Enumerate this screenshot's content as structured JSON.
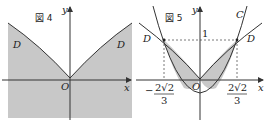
{
  "figure4": {
    "title": "図 4",
    "axis_y_label": "y",
    "axis_x_label": "x",
    "origin_label": "O",
    "curve_label_left": "D",
    "curve_label_right": "D",
    "shade_color": "#c8c8c8"
  },
  "figure5": {
    "title": "図 5",
    "axis_y_label": "y",
    "axis_x_label": "x",
    "origin_label": "O",
    "parabola_label": "C",
    "curve_label_left": "D",
    "curve_label_right": "D",
    "y_tick": "1",
    "x_tick_left_sign": "−",
    "x_tick_num": "2√2",
    "x_tick_den": "3",
    "x_tick_right_num": "2√2",
    "x_tick_right_den": "3",
    "shade_color": "#c8c8c8"
  }
}
